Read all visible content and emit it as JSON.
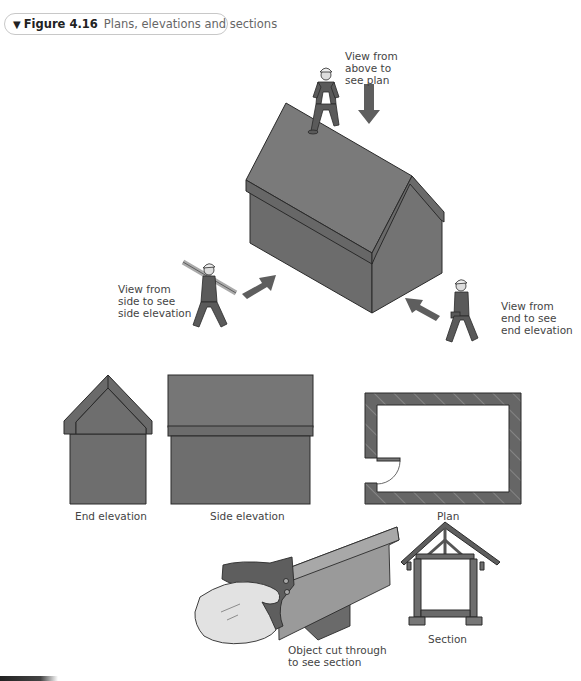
{
  "figure": {
    "number": "Figure 4.16",
    "caption": "Plans, elevations and sections",
    "icon": "triangle-down-icon"
  },
  "labels": {
    "view_above": "View from\nabove to\nsee plan",
    "view_side": "View from\nside to see\nside elevation",
    "view_end": "View from\nend to see\nend elevation",
    "end_elevation": "End elevation",
    "side_elevation": "Side elevation",
    "plan": "Plan",
    "object_cut": "Object cut through\nto see section",
    "section": "Section"
  },
  "colors": {
    "wall": "#6e6e6e",
    "wall_dark": "#5a5a5a",
    "roof": "#757575",
    "outline": "#2a2a2a",
    "arrow": "#5e5e5e",
    "hand": "#e2e2e2"
  }
}
